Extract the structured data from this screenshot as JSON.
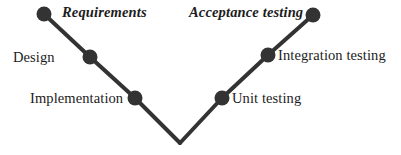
{
  "diagram": {
    "type": "v-model",
    "colors": {
      "background": "#ffffff",
      "stroke": "#333333",
      "node_fill": "#333333",
      "text": "#1c1c1c"
    },
    "geometry": {
      "width": 401,
      "height": 155,
      "vertex_x": 180,
      "vertex_y": 143,
      "line_width": 4,
      "node_radius": 7
    },
    "left_arm": {
      "name": "verification-arm",
      "nodes": [
        {
          "id": "requirements",
          "label": "Requirements",
          "style": "bold-italic",
          "cx": 44,
          "cy": 14,
          "label_side": "right"
        },
        {
          "id": "design",
          "label": "Design",
          "style": "regular",
          "cx": 90,
          "cy": 57,
          "label_side": "left"
        },
        {
          "id": "implementation",
          "label": "Implementation",
          "style": "regular",
          "cx": 135,
          "cy": 98,
          "label_side": "left"
        }
      ]
    },
    "right_arm": {
      "name": "validation-arm",
      "nodes": [
        {
          "id": "unit-testing",
          "label": "Unit testing",
          "style": "regular",
          "cx": 222,
          "cy": 98,
          "label_side": "right"
        },
        {
          "id": "integration-testing",
          "label": "Integration testing",
          "style": "regular",
          "cx": 268,
          "cy": 55,
          "label_side": "right"
        },
        {
          "id": "acceptance-testing",
          "label": "Acceptance testing",
          "style": "bold-italic",
          "cx": 313,
          "cy": 15,
          "label_side": "left"
        }
      ]
    },
    "labels": {
      "requirements": "Requirements",
      "acceptance_testing": "Acceptance testing",
      "design": "Design",
      "integration_testing": "Integration testing",
      "implementation": "Implementation",
      "unit_testing": "Unit testing"
    }
  }
}
